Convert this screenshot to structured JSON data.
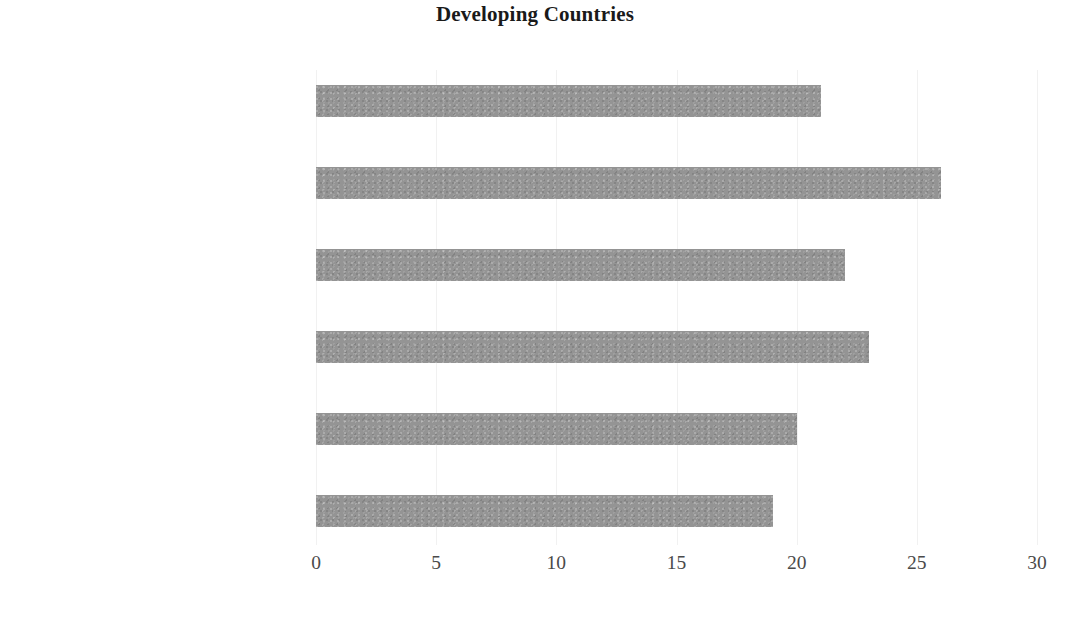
{
  "chart_data": {
    "type": "bar",
    "orientation": "horizontal",
    "title": "Developing Countries",
    "xlabel": "",
    "ylabel": "",
    "xlim": [
      0,
      30
    ],
    "ylim": null,
    "grid": false,
    "legend": null,
    "bar_color": "#949494",
    "background_color": "#ffffff",
    "xticks": [
      "0",
      "5",
      "10",
      "15",
      "20",
      "25",
      "30"
    ],
    "xtick_values": [
      0,
      5,
      10,
      15,
      20,
      25,
      30
    ],
    "categories": [
      "Brazil (2011- 2032)",
      "China (2000- 2026)",
      "Sri lanka (2004-2027)",
      "India (2004- 2030)",
      "Colombia (2017-2037)",
      "Singapore (2000-2019)"
    ],
    "values": [
      21,
      26,
      22,
      23,
      20,
      19
    ],
    "series": [
      {
        "name": "Years",
        "values": [
          21,
          26,
          22,
          23,
          20,
          19
        ]
      }
    ]
  }
}
